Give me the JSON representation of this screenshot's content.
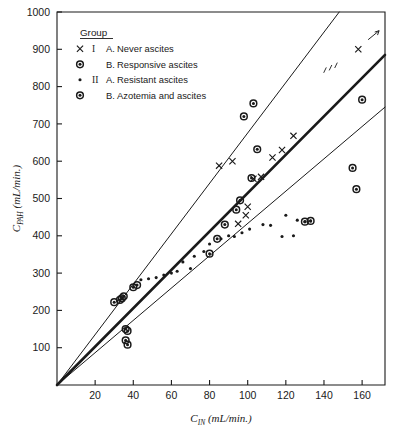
{
  "figure": {
    "background_color": "#ffffff",
    "ink_color": "#1a1a1a"
  },
  "legend": {
    "header": "Group",
    "items": [
      {
        "marker": "cross-marker",
        "group": "I",
        "sub": "A.",
        "label": "Never ascites"
      },
      {
        "marker": "circle-dot-marker",
        "group": "",
        "sub": "B.",
        "label": "Responsive ascites"
      },
      {
        "marker": "small-dot-marker",
        "group": "II",
        "sub": "A.",
        "label": "Resistant ascites"
      },
      {
        "marker": "circle-dot-marker",
        "group": "",
        "sub": "B.",
        "label": "Azotemia and ascites"
      }
    ]
  },
  "annotations": [
    {
      "name": "hatch-annotation",
      "text": "I.I.",
      "x": 143,
      "y": 845
    },
    {
      "name": "arrow-annotation",
      "text": "",
      "x": 160,
      "y": 915
    }
  ],
  "chart_data": {
    "type": "scatter",
    "title": "",
    "xlabel": "C_IN (mL/min.)",
    "xlabel_base": "C",
    "xlabel_sub": "IN",
    "xlabel_unit": "(mL/min.)",
    "ylabel": "C_PAH (mL/min.)",
    "ylabel_base": "C",
    "ylabel_sub": "PAH",
    "ylabel_unit": "(mL/min.)",
    "xlim": [
      0,
      172
    ],
    "ylim": [
      0,
      1000
    ],
    "xticks": [
      20,
      40,
      60,
      80,
      100,
      120,
      140,
      160
    ],
    "yticks": [
      100,
      200,
      300,
      400,
      500,
      600,
      700,
      800,
      900,
      1000
    ],
    "grid": false,
    "legend_position": "top-left",
    "series": [
      {
        "name": "I A. Never ascites",
        "marker": "cross-marker",
        "points": [
          [
            85,
            588
          ],
          [
            92,
            600
          ],
          [
            100,
            478
          ],
          [
            103,
            553
          ],
          [
            107,
            558
          ],
          [
            113,
            610
          ],
          [
            118,
            630
          ],
          [
            124,
            668
          ],
          [
            158,
            900
          ],
          [
            95,
            432
          ],
          [
            99,
            455
          ]
        ]
      },
      {
        "name": "I B. Responsive ascites",
        "marker": "circle-dot-marker",
        "points": [
          [
            30,
            222
          ],
          [
            34,
            232
          ],
          [
            36,
            150
          ],
          [
            37,
            145
          ],
          [
            98,
            720
          ],
          [
            103,
            755
          ],
          [
            105,
            632
          ],
          [
            102,
            555
          ],
          [
            96,
            495
          ],
          [
            94,
            470
          ],
          [
            88,
            430
          ],
          [
            84,
            392
          ],
          [
            80,
            352
          ]
        ]
      },
      {
        "name": "II A. Resistant ascites",
        "marker": "small-dot-marker",
        "points": [
          [
            44,
            282
          ],
          [
            56,
            295
          ],
          [
            60,
            300
          ],
          [
            66,
            330
          ],
          [
            72,
            345
          ],
          [
            77,
            358
          ],
          [
            80,
            378
          ],
          [
            86,
            392
          ],
          [
            90,
            400
          ],
          [
            93,
            398
          ],
          [
            97,
            408
          ],
          [
            101,
            418
          ],
          [
            108,
            430
          ],
          [
            112,
            428
          ],
          [
            120,
            455
          ],
          [
            126,
            442
          ],
          [
            130,
            438
          ],
          [
            133,
            440
          ],
          [
            70,
            312
          ],
          [
            63,
            305
          ],
          [
            52,
            288
          ],
          [
            48,
            285
          ],
          [
            118,
            398
          ],
          [
            124,
            400
          ]
        ]
      },
      {
        "name": "II B. Azotemia and ascites",
        "marker": "circle-dot-marker",
        "points": [
          [
            33,
            228
          ],
          [
            35,
            238
          ],
          [
            36,
            120
          ],
          [
            37,
            108
          ],
          [
            130,
            438
          ],
          [
            133,
            440
          ],
          [
            155,
            582
          ],
          [
            157,
            525
          ],
          [
            160,
            765
          ],
          [
            40,
            262
          ],
          [
            42,
            268
          ]
        ]
      }
    ],
    "lines": [
      {
        "name": "upper-regression-line",
        "style": "thin",
        "x1": 0,
        "y1": 0,
        "x2": 148,
        "y2": 1000
      },
      {
        "name": "middle-regression-line",
        "style": "thick",
        "x1": 0,
        "y1": 0,
        "x2": 172,
        "y2": 885
      },
      {
        "name": "lower-regression-line",
        "style": "thin",
        "x1": 0,
        "y1": 0,
        "x2": 172,
        "y2": 745
      }
    ]
  }
}
